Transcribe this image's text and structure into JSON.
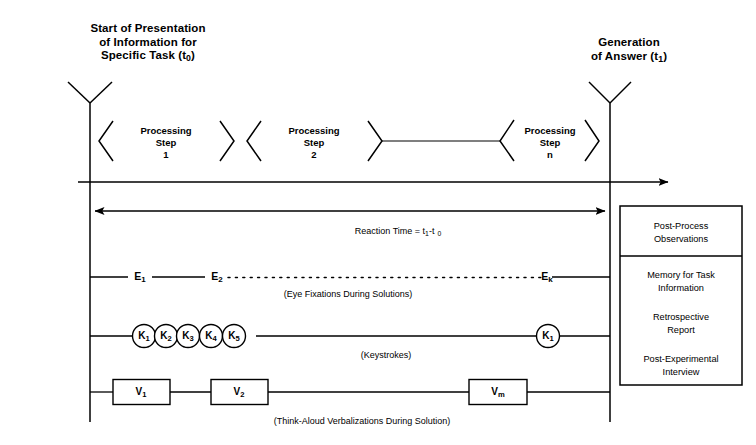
{
  "diagram": {
    "canvas": {
      "width": 756,
      "height": 445,
      "background": "#ffffff",
      "ink": "#000000"
    }
  },
  "headers": {
    "left": {
      "lines": [
        "Start of Presentation",
        "of Information for",
        "Specific Task (t"
      ],
      "subscript": "0",
      "tail": ")",
      "full": "Start of Presentation of Information for Specific Task (t0)"
    },
    "right": {
      "lines": [
        "Generation",
        "of Answer (t"
      ],
      "subscript": "1",
      "tail": ")",
      "full": "Generation of Answer (t1)"
    }
  },
  "processing_steps": [
    {
      "line1": "Processing",
      "line2": "Step",
      "line3": "1"
    },
    {
      "line1": "Processing",
      "line2": "Step",
      "line3": "2"
    },
    {
      "line1": "Processing",
      "line2": "Step",
      "line3": "n"
    }
  ],
  "reaction_time": {
    "prefix": "Reaction Time = t",
    "sub1": "1",
    "mid": "-t",
    "sub2": "0",
    "full": "Reaction Time = t1-t0"
  },
  "rows": {
    "eye": {
      "nodes": [
        {
          "base": "E",
          "sub": "1"
        },
        {
          "base": "E",
          "sub": "2"
        },
        {
          "base": "E",
          "sub": "k"
        }
      ],
      "caption": "(Eye Fixations During Solutions)"
    },
    "keystrokes": {
      "nodes": [
        {
          "base": "K",
          "sub": "1"
        },
        {
          "base": "K",
          "sub": "2"
        },
        {
          "base": "K",
          "sub": "3"
        },
        {
          "base": "K",
          "sub": "4"
        },
        {
          "base": "K",
          "sub": "5"
        },
        {
          "base": "K",
          "sub": "1"
        }
      ],
      "caption": "(Keystrokes)"
    },
    "verbalizations": {
      "nodes": [
        {
          "base": "V",
          "sub": "1"
        },
        {
          "base": "V",
          "sub": "2"
        },
        {
          "base": "V",
          "sub": "m"
        }
      ],
      "caption": "(Think-Aloud Verbalizations During Solution)"
    }
  },
  "panel": {
    "header": "Post-Process\nObservations",
    "items": [
      "Memory for Task\nInformation",
      "Retrospective\nReport",
      "Post-Experimental\nInterview"
    ]
  }
}
